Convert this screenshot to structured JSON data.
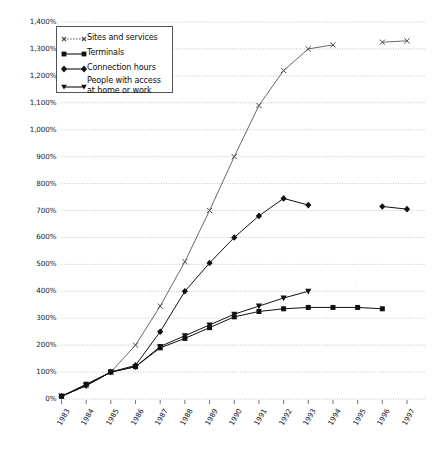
{
  "chart_data": {
    "type": "line",
    "title": "",
    "subtitle": "",
    "xlabel": "",
    "ylabel": "",
    "grid": true,
    "legend_position": "top-left",
    "ylim": [
      0,
      1400
    ],
    "ytick_step": 100,
    "ytick_labels": [
      "0%",
      "100%",
      "200%",
      "300%",
      "400%",
      "500%",
      "600%",
      "700%",
      "800%",
      "900%",
      "1,000%",
      "1,100%",
      "1,200%",
      "1,300%",
      "1,400%"
    ],
    "ytick_values": [
      0,
      100,
      200,
      300,
      400,
      500,
      600,
      700,
      800,
      900,
      1000,
      1100,
      1200,
      1300,
      1400
    ],
    "categories": [
      "1983",
      "1984",
      "1985",
      "1986",
      "1987",
      "1988",
      "1989",
      "1990",
      "1991",
      "1992",
      "1993",
      "1994",
      "1995",
      "1996",
      "1997"
    ],
    "series": [
      {
        "name": "Sites and services",
        "marker": "x",
        "color": "#4d4d4d",
        "values": [
          10,
          50,
          100,
          200,
          345,
          510,
          700,
          900,
          1090,
          1220,
          1300,
          1315,
          null,
          1325,
          1330
        ]
      },
      {
        "name": "Terminals",
        "marker": "square",
        "color": "#111111",
        "values": [
          10,
          55,
          100,
          120,
          190,
          225,
          265,
          305,
          325,
          335,
          340,
          340,
          340,
          335,
          null
        ]
      },
      {
        "name": "Connection hours",
        "marker": "diamond",
        "color": "#111111",
        "values": [
          10,
          50,
          100,
          125,
          250,
          400,
          505,
          600,
          680,
          745,
          720,
          null,
          null,
          715,
          705
        ]
      },
      {
        "name": "People with access at home or work",
        "marker": "triangle-down",
        "color": "#111111",
        "values": [
          10,
          50,
          100,
          120,
          195,
          235,
          275,
          315,
          345,
          375,
          400,
          null,
          null,
          null,
          null
        ]
      }
    ]
  },
  "legend": {
    "items": [
      {
        "label": "Sites and services",
        "marker": "x-marker-icon"
      },
      {
        "label": "Terminals",
        "marker": "square-marker-icon"
      },
      {
        "label": "Connection hours",
        "marker": "diamond-marker-icon"
      },
      {
        "label": "People with access\nat home or work",
        "marker": "triangle-down-marker-icon"
      }
    ]
  },
  "style": {
    "grid_color": "#b9b9b9",
    "axis_text_color": "#1a1a1a",
    "background": "#ffffff"
  }
}
